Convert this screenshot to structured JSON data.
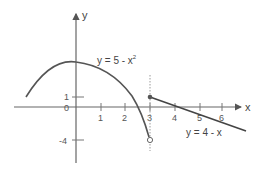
{
  "diagram": {
    "type": "piecewise-function-graph",
    "axes": {
      "x_label": "x",
      "y_label": "y",
      "x_ticks": [
        "1",
        "2",
        "3",
        "4",
        "5",
        "6"
      ],
      "y_ticks": [
        "1",
        "0",
        "-4"
      ]
    },
    "curves": [
      {
        "label": "y = 5 - x",
        "exponent": "2",
        "kind": "parabola",
        "domain": "x < 3",
        "end_marker": "open circle at (3, -4)"
      },
      {
        "label": "y = 4 - x",
        "kind": "line",
        "domain": "x ≥ 3",
        "start_marker": "closed dot at (3, 1)"
      }
    ],
    "guide": {
      "kind": "dotted vertical line",
      "at_x": "3"
    },
    "colors": {
      "curve": "#555555",
      "axis": "#555555",
      "guide": "#999999"
    }
  }
}
